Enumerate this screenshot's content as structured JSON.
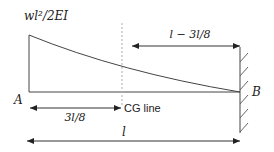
{
  "diagram": {
    "labels": {
      "top_value": "wl²/2EI",
      "right_span": "l − 3l/8",
      "point_a": "A",
      "point_b": "B",
      "left_span": "3l/8",
      "cg_line": "CG line",
      "total_length": "l"
    },
    "colors": {
      "line": "#333333",
      "cg_dashed": "#b0b0b0",
      "text": "#222222",
      "background": "#ffffff"
    }
  }
}
